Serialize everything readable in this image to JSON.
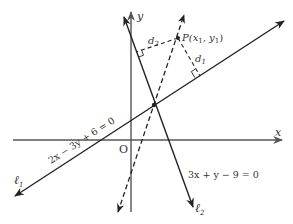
{
  "diagram": {
    "type": "coordinate-geometry",
    "colors": {
      "ink": "#222222",
      "axis": "#555555",
      "background": "#ffffff"
    },
    "axes": {
      "x_label": "x",
      "y_label": "y",
      "origin_label": "O"
    },
    "lines": [
      {
        "id": "l1",
        "name": "ℓ",
        "subscript": "1",
        "equation": "2x − 3y + 6 = 0",
        "style": "solid"
      },
      {
        "id": "l2",
        "name": "ℓ",
        "subscript": "2",
        "equation": "3x + y − 9 = 0",
        "style": "solid"
      },
      {
        "id": "bisector",
        "style": "dashed"
      }
    ],
    "point": {
      "label_prefix": "P(x",
      "sub1": "1",
      "mid": ", y",
      "sub2": "1",
      "suffix": ")"
    },
    "distances": [
      {
        "name": "d",
        "subscript": "1",
        "to": "l1"
      },
      {
        "name": "d",
        "subscript": "2",
        "to": "l2"
      }
    ]
  }
}
